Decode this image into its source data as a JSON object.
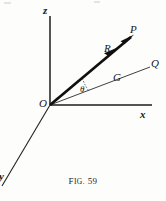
{
  "figure": {
    "caption_prefix": "F",
    "caption_small": "IG.",
    "caption_number": "59",
    "caption_full": "FIG. 59",
    "background_color": "#fdfdfc",
    "ink_color": "#171717"
  },
  "axes": {
    "z": {
      "label": "z",
      "from": [
        50,
        105
      ],
      "to": [
        50,
        16
      ]
    },
    "x": {
      "label": "x",
      "from": [
        50,
        105
      ],
      "to": [
        152,
        105
      ]
    },
    "y": {
      "label": "y",
      "from": [
        50,
        105
      ],
      "to": [
        2,
        186
      ]
    }
  },
  "vectors": {
    "R": {
      "label": "R",
      "tip_label": "P",
      "from": [
        50,
        105
      ],
      "to": [
        133,
        36
      ],
      "arrowhead": true,
      "stroke_width": 2.6
    },
    "G": {
      "label": "G",
      "tip_label": "Q",
      "from": [
        50,
        105
      ],
      "to": [
        150,
        67
      ],
      "arrowhead": false,
      "stroke_width": 0.9
    }
  },
  "angle": {
    "symbol": "θ",
    "name": "theta",
    "between": [
      "G",
      "R"
    ],
    "vertex": [
      50,
      105
    ]
  },
  "labels": {
    "z_axis": "z",
    "x_axis": "x",
    "y_axis": "y",
    "origin": "O",
    "point_p": "P",
    "point_q": "Q",
    "vector_r": "R",
    "line_g": "G",
    "angle_theta": "θ"
  }
}
